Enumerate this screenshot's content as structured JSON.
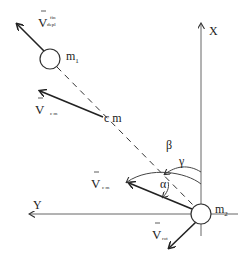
{
  "diagram": {
    "masses": {
      "m1": {
        "label": "m",
        "sub": "1"
      },
      "m2": {
        "label": "m",
        "sub": "2"
      }
    },
    "center_of_mass": {
      "label": "c m"
    },
    "axes": {
      "x": {
        "label": "X"
      },
      "y": {
        "label": "Y"
      }
    },
    "vectors": {
      "v_depl_fin": {
        "symbol": "V",
        "sub": "depl",
        "sup": "fin"
      },
      "v_cm_upper": {
        "symbol": "V",
        "sub": "c m"
      },
      "v_cm_lower": {
        "symbol": "V",
        "sub": "c m"
      },
      "v_rot": {
        "symbol": "V",
        "sub": "rot"
      }
    },
    "angles": {
      "alpha": "α",
      "beta": "β",
      "gamma": "γ"
    },
    "colors": {
      "line": "#222222",
      "axis": "#555555",
      "background": "#ffffff"
    }
  }
}
